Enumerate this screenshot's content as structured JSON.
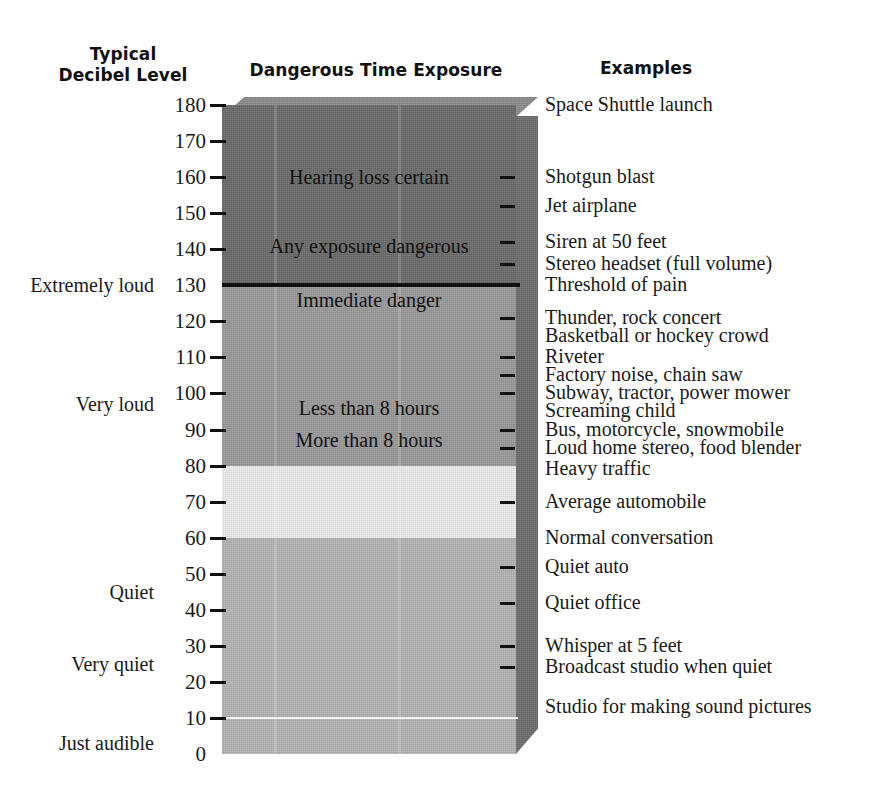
{
  "headers": {
    "decibel": "Typical\nDecibel Level",
    "exposure": "Dangerous Time Exposure",
    "examples": "Examples"
  },
  "chart_data": {
    "type": "bar",
    "xlabel": "",
    "ylabel": "Decibel Level (dB)",
    "ylim": [
      0,
      180
    ],
    "grid": false,
    "legend": "none",
    "axis_ticks": [
      0,
      10,
      20,
      30,
      40,
      50,
      60,
      70,
      80,
      90,
      100,
      110,
      120,
      130,
      140,
      150,
      160,
      170,
      180
    ],
    "axis_tick_labels": [
      "0",
      "10",
      "20",
      "30",
      "40",
      "50",
      "60",
      "70",
      "80",
      "90",
      "100",
      "110",
      "120",
      "130",
      "140",
      "150",
      "160",
      "170",
      "180"
    ],
    "bands": [
      {
        "name": "extreme",
        "from": 130,
        "to": 180,
        "color": "#6b6b6b"
      },
      {
        "name": "very-loud",
        "from": 80,
        "to": 130,
        "color": "#9a9a9a"
      },
      {
        "name": "moderate",
        "from": 60,
        "to": 80,
        "color": "#ededed"
      },
      {
        "name": "quiet",
        "from": 0,
        "to": 60,
        "color": "#b4b4b4"
      }
    ],
    "rules": [
      {
        "at": 130,
        "color": "#111111",
        "weight": 4
      },
      {
        "at": 10,
        "color": "#f4f4f4",
        "weight": 2
      }
    ],
    "categories_left": [
      {
        "label": "Extremely loud",
        "db": 130
      },
      {
        "label": "Very loud",
        "db": 97
      },
      {
        "label": "Quiet",
        "db": 45
      },
      {
        "label": "Very quiet",
        "db": 25
      },
      {
        "label": "Just audible",
        "db": 3
      }
    ],
    "exposure_labels": [
      {
        "label": "Hearing loss certain",
        "db": 160
      },
      {
        "label": "Any exposure dangerous",
        "db": 141
      },
      {
        "label": "Immediate danger",
        "db": 126
      },
      {
        "label": "Less than 8 hours",
        "db": 96
      },
      {
        "label": "More than 8 hours",
        "db": 87
      }
    ],
    "examples": [
      {
        "label": "Space Shuttle launch",
        "db": 180,
        "tick": false
      },
      {
        "label": "Shotgun blast",
        "db": 160,
        "tick": true
      },
      {
        "label": "Jet airplane",
        "db": 152,
        "tick": true
      },
      {
        "label": "Siren at 50 feet",
        "db": 142,
        "tick": true
      },
      {
        "label": "Stereo headset (full volume)",
        "db": 136,
        "tick": true
      },
      {
        "label": "Threshold of pain",
        "db": 130,
        "tick": false
      },
      {
        "label": "Thunder, rock concert",
        "db": 121,
        "tick": true
      },
      {
        "label": "Basketball or hockey crowd",
        "db": 116,
        "tick": false
      },
      {
        "label": "Riveter",
        "db": 110,
        "tick": true
      },
      {
        "label": "Factory noise, chain saw",
        "db": 105,
        "tick": true
      },
      {
        "label": "Subway, tractor, power mower",
        "db": 100,
        "tick": true
      },
      {
        "label": "Screaming child",
        "db": 95,
        "tick": false
      },
      {
        "label": "Bus, motorcycle, snowmobile",
        "db": 90,
        "tick": true
      },
      {
        "label": "Loud home stereo, food blender",
        "db": 85,
        "tick": true
      },
      {
        "label": "Heavy traffic",
        "db": 79,
        "tick": false
      },
      {
        "label": "Average automobile",
        "db": 70,
        "tick": true
      },
      {
        "label": "Normal conversation",
        "db": 60,
        "tick": false
      },
      {
        "label": "Quiet auto",
        "db": 52,
        "tick": true
      },
      {
        "label": "Quiet office",
        "db": 42,
        "tick": true
      },
      {
        "label": "Whisper at 5 feet",
        "db": 30,
        "tick": true
      },
      {
        "label": "Broadcast studio when quiet",
        "db": 24,
        "tick": true
      },
      {
        "label": "Studio for making sound pictures",
        "db": 13,
        "tick": false
      }
    ]
  }
}
